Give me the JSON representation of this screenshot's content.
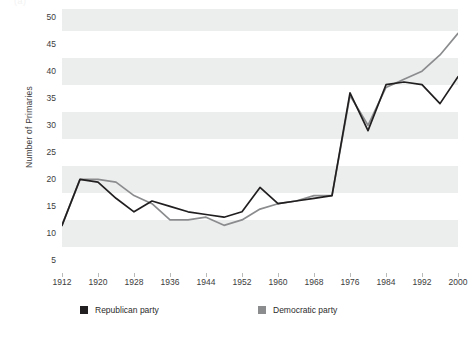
{
  "figure": {
    "background_color": "#ffffff",
    "band_color": "#eceded",
    "top_sliver_text": "(a)"
  },
  "chart_data": {
    "type": "line",
    "title": "",
    "xlabel": "",
    "ylabel": "Number of Primaries",
    "xlim": [
      1912,
      2000
    ],
    "ylim": [
      2.5,
      51.5
    ],
    "yticks": [
      5,
      10,
      15,
      20,
      25,
      30,
      35,
      40,
      45,
      50
    ],
    "xticks": [
      1912,
      1920,
      1928,
      1936,
      1944,
      1952,
      1960,
      1968,
      1976,
      1984,
      1992,
      2000
    ],
    "grid": "horizontal-banding",
    "legend_position": "bottom",
    "x": [
      1912,
      1916,
      1920,
      1924,
      1928,
      1932,
      1936,
      1940,
      1944,
      1948,
      1952,
      1956,
      1960,
      1964,
      1968,
      1972,
      1976,
      1980,
      1984,
      1988,
      1992,
      1996,
      2000
    ],
    "series": [
      {
        "name": "Republican party",
        "color": "#211f1f",
        "values": [
          11.5,
          20,
          19.5,
          16.5,
          14,
          16,
          15,
          14,
          13.5,
          13,
          14,
          18.5,
          15.5,
          16,
          16.5,
          17,
          36,
          29,
          37.5,
          38,
          37.5,
          34,
          39
        ]
      },
      {
        "name": "Democratic party",
        "color": "#8b8c8e",
        "values": [
          11.5,
          20,
          20,
          19.5,
          17,
          15.5,
          12.5,
          12.5,
          13,
          11.5,
          12.5,
          14.5,
          15.5,
          16,
          17,
          17,
          35.5,
          30,
          37,
          38.5,
          40,
          43,
          47
        ]
      }
    ]
  },
  "y_axis": {
    "title": "Number of Primaries",
    "ticks": [
      "50",
      "45",
      "40",
      "35",
      "30",
      "25",
      "20",
      "15",
      "10",
      "5"
    ]
  },
  "x_axis": {
    "ticks": [
      "1912",
      "1920",
      "1928",
      "1936",
      "1944",
      "1952",
      "1960",
      "1968",
      "1976",
      "1984",
      "1992",
      "2000"
    ]
  },
  "legend": {
    "items": [
      {
        "label": "Republican party",
        "color": "#211f1f"
      },
      {
        "label": "Democratic party",
        "color": "#8b8c8e"
      }
    ]
  }
}
